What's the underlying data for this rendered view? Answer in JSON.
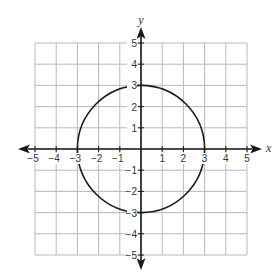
{
  "chart_data": {
    "type": "line",
    "title": "",
    "xlabel": "x",
    "ylabel": "y",
    "xlim": [
      -5,
      5
    ],
    "ylim": [
      -5,
      5
    ],
    "grid": true,
    "grid_step": 1,
    "x_ticks": [
      -5,
      -4,
      -3,
      -2,
      -1,
      1,
      2,
      3,
      4,
      5
    ],
    "y_ticks": [
      5,
      4,
      3,
      2,
      1,
      -1,
      -2,
      -3,
      -4,
      -5
    ],
    "x_tick_labels": [
      "−5",
      "−4",
      "−3",
      "−2",
      "−1",
      "1",
      "2",
      "3",
      "4",
      "5"
    ],
    "y_tick_labels": [
      "5",
      "4",
      "3",
      "2",
      "1",
      "−1",
      "−2",
      "−3",
      "−4",
      "−5"
    ],
    "series": [
      {
        "name": "circle",
        "shape": "circle",
        "equation": "x^2 + y^2 = 9",
        "center": [
          0,
          0
        ],
        "radius": 3,
        "color": "#1a1a1a"
      }
    ],
    "axes_arrows": true,
    "legend": "none"
  }
}
